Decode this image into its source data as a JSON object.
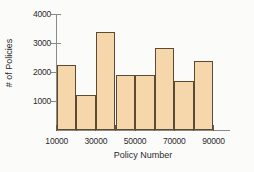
{
  "chart_data": {
    "type": "bar",
    "title": "",
    "subtitle": "",
    "xlabel": "Policy Number",
    "ylabel": "# of Policies",
    "categories": [
      "10000-20000",
      "20000-30000",
      "30000-40000",
      "40000-50000",
      "50000-60000",
      "60000-70000",
      "70000-80000",
      "80000-90000"
    ],
    "bin_edges": [
      10000,
      20000,
      30000,
      40000,
      50000,
      60000,
      70000,
      80000,
      90000
    ],
    "values": [
      2250,
      1200,
      3400,
      1900,
      1920,
      2850,
      1680,
      2380
    ],
    "x_tick_labels": [
      "10000",
      "30000",
      "50000",
      "70000",
      "90000"
    ],
    "x_tick_values": [
      10000,
      30000,
      50000,
      70000,
      90000
    ],
    "x_minor_tick_values": [
      20000,
      40000,
      60000,
      80000
    ],
    "y_tick_labels": [
      "1000",
      "2000",
      "3000",
      "4000"
    ],
    "y_tick_values": [
      1000,
      2000,
      3000,
      4000
    ],
    "xlim": [
      10000,
      90000
    ],
    "ylim": [
      0,
      4300
    ],
    "grid": false,
    "legend": false,
    "legend_position": "none",
    "bar_fill_color": "#f6d7ab",
    "bar_edge_color": "#5c4a33",
    "axis_color": "#8a8a86",
    "background_color": "#fbfbfa",
    "text_color": "#2b2b2b"
  }
}
